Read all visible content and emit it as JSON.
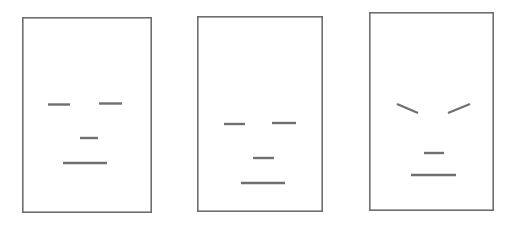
{
  "canvas": {
    "width": 514,
    "height": 232,
    "background_color": "#ffffff",
    "description": "Three schematic line-drawing faces shown side by side in rectangular frames"
  },
  "style": {
    "frame_stroke_color": "#6e6e6e",
    "frame_stroke_width": 1.6,
    "frame_fill_color": "#ffffff",
    "feature_stroke_color": "#707070",
    "feature_stroke_width": 2.4
  },
  "faces": [
    {
      "id": "face-1",
      "label": "neutral-face-left",
      "expression": "neutral",
      "frame": {
        "x": 22,
        "y": 17,
        "width": 130,
        "height": 196
      },
      "features": [
        {
          "name": "left-eye",
          "type": "line",
          "x1": 48,
          "y1": 104.5,
          "x2": 70,
          "y2": 104.5
        },
        {
          "name": "right-eye",
          "type": "line",
          "x1": 99,
          "y1": 103.5,
          "x2": 122,
          "y2": 103.5
        },
        {
          "name": "nose",
          "type": "line",
          "x1": 80,
          "y1": 138,
          "x2": 98,
          "y2": 138
        },
        {
          "name": "mouth",
          "type": "line",
          "x1": 63,
          "y1": 163,
          "x2": 107,
          "y2": 163
        }
      ]
    },
    {
      "id": "face-2",
      "label": "neutral-face-middle",
      "expression": "neutral",
      "frame": {
        "x": 197,
        "y": 16,
        "width": 126,
        "height": 196
      },
      "features": [
        {
          "name": "left-eye",
          "type": "line",
          "x1": 224,
          "y1": 124,
          "x2": 245,
          "y2": 124
        },
        {
          "name": "right-eye",
          "type": "line",
          "x1": 272,
          "y1": 123,
          "x2": 296,
          "y2": 123
        },
        {
          "name": "nose",
          "type": "line",
          "x1": 253,
          "y1": 158,
          "x2": 274,
          "y2": 158
        },
        {
          "name": "mouth",
          "type": "line",
          "x1": 241,
          "y1": 183,
          "x2": 285,
          "y2": 183
        }
      ]
    },
    {
      "id": "face-3",
      "label": "angry-face-right",
      "expression": "angry",
      "frame": {
        "x": 369,
        "y": 12,
        "width": 125,
        "height": 199
      },
      "features": [
        {
          "name": "left-eyebrow",
          "type": "line",
          "x1": 397,
          "y1": 104,
          "x2": 418,
          "y2": 113
        },
        {
          "name": "right-eyebrow",
          "type": "line",
          "x1": 448,
          "y1": 113,
          "x2": 470,
          "y2": 104
        },
        {
          "name": "nose",
          "type": "line",
          "x1": 424,
          "y1": 153,
          "x2": 444,
          "y2": 153
        },
        {
          "name": "mouth",
          "type": "line",
          "x1": 411,
          "y1": 175,
          "x2": 456,
          "y2": 175
        }
      ]
    }
  ]
}
